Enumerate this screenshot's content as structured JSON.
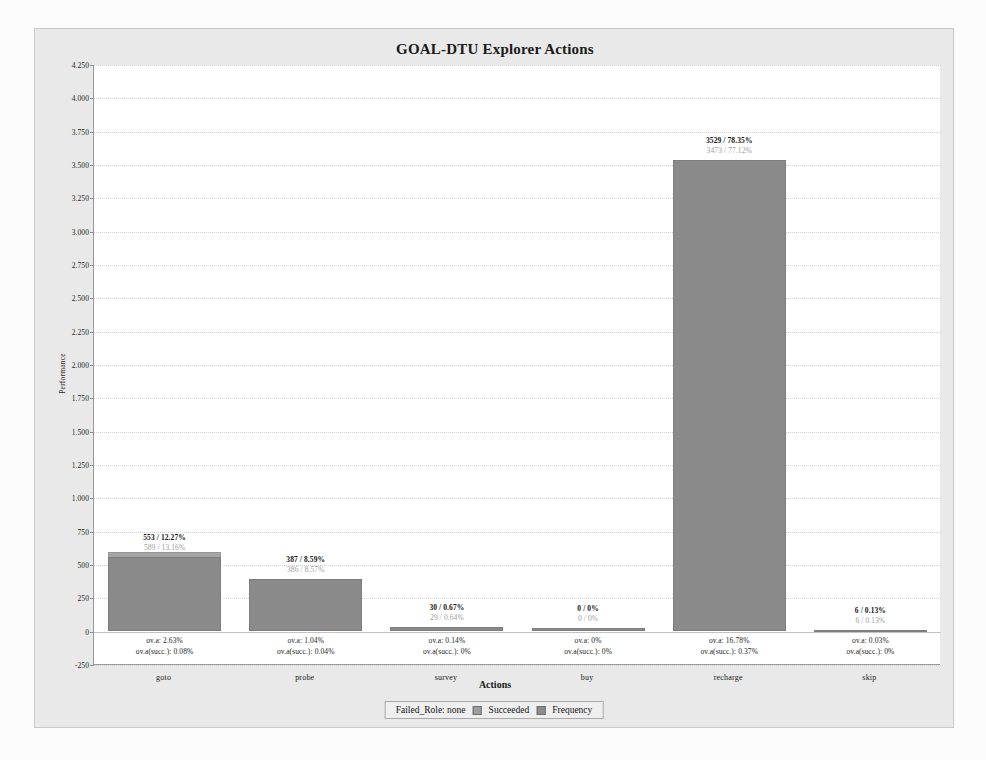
{
  "chart_data": {
    "type": "bar",
    "title": "GOAL-DTU Explorer Actions",
    "xlabel": "Actions",
    "ylabel": "Performance",
    "categories": [
      "goto",
      "probe",
      "survey",
      "buy",
      "recharge",
      "skip"
    ],
    "ylim": [
      -250,
      4250
    ],
    "yticks": [
      "4.250",
      "4.000",
      "3.750",
      "3.500",
      "3.250",
      "3.000",
      "2.750",
      "2.500",
      "2.250",
      "2.000",
      "1.750",
      "1.500",
      "1.250",
      "1.000",
      "750",
      "500",
      "250",
      "0",
      "-250"
    ],
    "ytick_values": [
      4250,
      4000,
      3750,
      3500,
      3250,
      3000,
      2750,
      2500,
      2250,
      2000,
      1750,
      1500,
      1250,
      1000,
      750,
      500,
      250,
      0,
      -250
    ],
    "grid": true,
    "legend_position": "bottom",
    "series": [
      {
        "name": "Frequency",
        "values": [
          553,
          387,
          30,
          0,
          3529,
          6
        ]
      },
      {
        "name": "Succeeded",
        "values": [
          589,
          386,
          29,
          0,
          3473,
          6
        ]
      }
    ],
    "bars": [
      {
        "category": "goto",
        "frequency": 553,
        "frequency_pct": "12.27%",
        "top_label_primary": "553 / 12.27%",
        "top_label_secondary": "589 / 13.16%",
        "bottom_label_primary": "ov.a: 2.63%",
        "bottom_label_secondary": "ov.a(succ.): 0.08%"
      },
      {
        "category": "probe",
        "frequency": 387,
        "frequency_pct": "8.59%",
        "top_label_primary": "387 / 8.59%",
        "top_label_secondary": "386 / 8.57%",
        "bottom_label_primary": "ov.a: 1.04%",
        "bottom_label_secondary": "ov.a(succ.): 0.04%"
      },
      {
        "category": "survey",
        "frequency": 30,
        "frequency_pct": "0.67%",
        "top_label_primary": "30 / 0.67%",
        "top_label_secondary": "29 / 0.64%",
        "bottom_label_primary": "ov.a: 0.14%",
        "bottom_label_secondary": "ov.a(succ.): 0%"
      },
      {
        "category": "buy",
        "frequency": 0,
        "frequency_pct": "0%",
        "top_label_primary": "0 / 0%",
        "top_label_secondary": "0 / 0%",
        "bottom_label_primary": "ov.a: 0%",
        "bottom_label_secondary": "ov.a(succ.): 0%"
      },
      {
        "category": "recharge",
        "frequency": 3529,
        "frequency_pct": "78.35%",
        "top_label_primary": "3529 / 78.35%",
        "top_label_secondary": "3473 / 77.12%",
        "bottom_label_primary": "ov.a: 16.78%",
        "bottom_label_secondary": "ov.a(succ.): 0.37%"
      },
      {
        "category": "skip",
        "frequency": 6,
        "frequency_pct": "0.13%",
        "top_label_primary": "6 / 0.13%",
        "top_label_secondary": "6 / 0.13%",
        "bottom_label_primary": "ov.a: 0.03%",
        "bottom_label_secondary": "ov.a(succ.): 0%"
      }
    ],
    "legend": {
      "prefix": "Failed_Role: none",
      "entries": [
        "Succeeded",
        "Frequency"
      ]
    },
    "colors": {
      "bar_frequency": "#8a8a8a",
      "bar_succeeded": "#9e9e9e",
      "panel_background": "#e9e9e9",
      "plot_background": "#ffffff",
      "gridline": "#d0d0d0",
      "axis": "#9a9a9a"
    }
  }
}
